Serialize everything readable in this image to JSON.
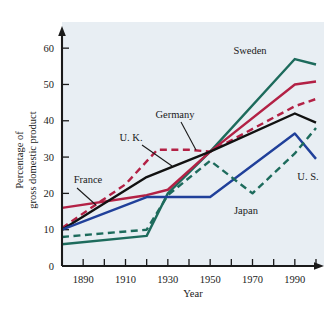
{
  "chart_data": {
    "type": "line",
    "title": "",
    "xlabel": "Year",
    "ylabel": "Percentage of gross domestic product",
    "ylabel_line1": "Percentage of",
    "ylabel_line2": "gross domestic product",
    "xlim": [
      1880,
      2000
    ],
    "ylim": [
      0,
      65
    ],
    "yticks": [
      0,
      10,
      20,
      30,
      40,
      50,
      60
    ],
    "ytick_labels": [
      "0",
      "10",
      "20",
      "30",
      "40",
      "50",
      "60"
    ],
    "xticks": [
      1890,
      1900,
      1910,
      1920,
      1930,
      1940,
      1950,
      1960,
      1970,
      1980,
      1990,
      2000
    ],
    "xtick_labels_shown": [
      "1890",
      "1910",
      "1930",
      "1950",
      "1970",
      "1990"
    ],
    "xtick_labeled_values": [
      1890,
      1910,
      1930,
      1950,
      1970,
      1990
    ],
    "grid": false,
    "legend_position": "inline-annotations",
    "series": [
      {
        "name": "Sweden",
        "color": "#1d6b5c",
        "style": "solid",
        "x": [
          1880,
          1920,
          1930,
          1950,
          1990,
          2000
        ],
        "values": [
          6,
          8.3,
          20,
          31.5,
          57,
          55.5
        ]
      },
      {
        "name": "France",
        "color": "#b32145",
        "style": "solid",
        "x": [
          1880,
          1920,
          1930,
          1950,
          1990,
          2000
        ],
        "values": [
          16,
          19.5,
          21,
          31.5,
          50,
          50.8
        ]
      },
      {
        "name": "Germany",
        "color": "#b32145",
        "style": "dashed",
        "x": [
          1880,
          1910,
          1925,
          1940,
          1950,
          1990,
          2000
        ],
        "values": [
          10.5,
          22.5,
          32,
          32,
          31.5,
          44,
          46
        ]
      },
      {
        "name": "U. K.",
        "color": "#111111",
        "style": "solid",
        "x": [
          1880,
          1920,
          1950,
          1990,
          2000
        ],
        "values": [
          10,
          24.5,
          31.5,
          42,
          39.5
        ]
      },
      {
        "name": "U. S.",
        "color": "#20409a",
        "style": "solid",
        "x": [
          1880,
          1920,
          1950,
          1990,
          2000
        ],
        "values": [
          10,
          19,
          19,
          36.5,
          29.5
        ]
      },
      {
        "name": "Japan",
        "color": "#1d6b5c",
        "style": "dashed",
        "x": [
          1880,
          1920,
          1930,
          1950,
          1970,
          1990,
          2000
        ],
        "values": [
          8,
          10,
          19.5,
          29,
          20,
          31,
          38
        ]
      }
    ],
    "annotations": [
      {
        "label": "Sweden",
        "x": 250,
        "y": 54,
        "anchor": "middle",
        "leader": null
      },
      {
        "label": "Germany",
        "x": 175,
        "y": 118,
        "anchor": "middle",
        "leader": [
          [
            181,
            122
          ],
          [
            196,
            150
          ]
        ]
      },
      {
        "label": "U. K.",
        "x": 131,
        "y": 141,
        "anchor": "middle",
        "leader": [
          [
            142,
            145
          ],
          [
            172,
            166
          ]
        ]
      },
      {
        "label": "France",
        "x": 88,
        "y": 183,
        "anchor": "middle",
        "leader": [
          [
            77,
            188
          ],
          [
            96,
            205
          ]
        ]
      },
      {
        "label": "Japan",
        "x": 246,
        "y": 214,
        "anchor": "middle",
        "leader": null
      },
      {
        "label": "U. S.",
        "x": 308,
        "y": 180,
        "anchor": "middle",
        "leader": null
      }
    ]
  },
  "colors": {
    "plot_background": "#e8eef3",
    "page_background": "#ffffff",
    "axis": "#1a1a1a",
    "sweden": "#1d6b5c",
    "france": "#b32145",
    "germany": "#b32145",
    "uk": "#111111",
    "us": "#20409a",
    "japan": "#1d6b5c"
  }
}
